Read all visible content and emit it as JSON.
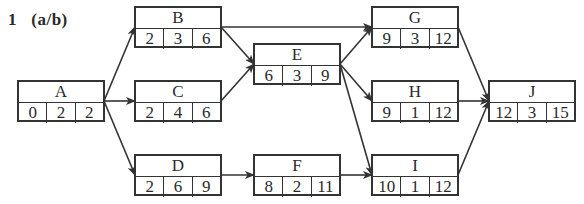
{
  "title": "1   (a/b)",
  "colors": {
    "line": "#333333",
    "background": "#ffffff"
  },
  "nodes": [
    {
      "id": "A",
      "name": "A",
      "es": "0",
      "dur": "2",
      "ef": "2",
      "x": 17,
      "y": 80
    },
    {
      "id": "B",
      "name": "B",
      "es": "2",
      "dur": "3",
      "ef": "6",
      "x": 134,
      "y": 6
    },
    {
      "id": "C",
      "name": "C",
      "es": "2",
      "dur": "4",
      "ef": "6",
      "x": 134,
      "y": 80
    },
    {
      "id": "D",
      "name": "D",
      "es": "2",
      "dur": "6",
      "ef": "9",
      "x": 134,
      "y": 154
    },
    {
      "id": "E",
      "name": "E",
      "es": "6",
      "dur": "3",
      "ef": "9",
      "x": 253,
      "y": 43
    },
    {
      "id": "F",
      "name": "F",
      "es": "8",
      "dur": "2",
      "ef": "11",
      "x": 253,
      "y": 154
    },
    {
      "id": "G",
      "name": "G",
      "es": "9",
      "dur": "3",
      "ef": "12",
      "x": 371,
      "y": 6
    },
    {
      "id": "H",
      "name": "H",
      "es": "9",
      "dur": "1",
      "ef": "12",
      "x": 371,
      "y": 80
    },
    {
      "id": "I",
      "name": "I",
      "es": "10",
      "dur": "1",
      "ef": "12",
      "x": 371,
      "y": 154
    },
    {
      "id": "J",
      "name": "J",
      "es": "12",
      "dur": "3",
      "ef": "15",
      "x": 488,
      "y": 80
    }
  ],
  "edges": [
    [
      "A",
      "B"
    ],
    [
      "A",
      "C"
    ],
    [
      "A",
      "D"
    ],
    [
      "B",
      "E"
    ],
    [
      "B",
      "G"
    ],
    [
      "C",
      "E"
    ],
    [
      "D",
      "F"
    ],
    [
      "E",
      "G"
    ],
    [
      "E",
      "H"
    ],
    [
      "E",
      "I"
    ],
    [
      "F",
      "I"
    ],
    [
      "G",
      "J"
    ],
    [
      "H",
      "J"
    ],
    [
      "I",
      "J"
    ]
  ]
}
